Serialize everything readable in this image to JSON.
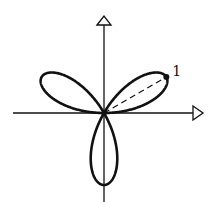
{
  "diagram": {
    "type": "polar-rose",
    "equation": "r = sin 3θ",
    "petals": 3,
    "petal_angles_deg": [
      30,
      150,
      270
    ],
    "max_radius": 1,
    "marked_point": {
      "label": "1",
      "angle_deg": 30,
      "radius": 1
    },
    "axes": {
      "x_arrow": true,
      "y_arrow": true
    },
    "colors": {
      "stroke": "#111111",
      "background": "#ffffff"
    }
  }
}
